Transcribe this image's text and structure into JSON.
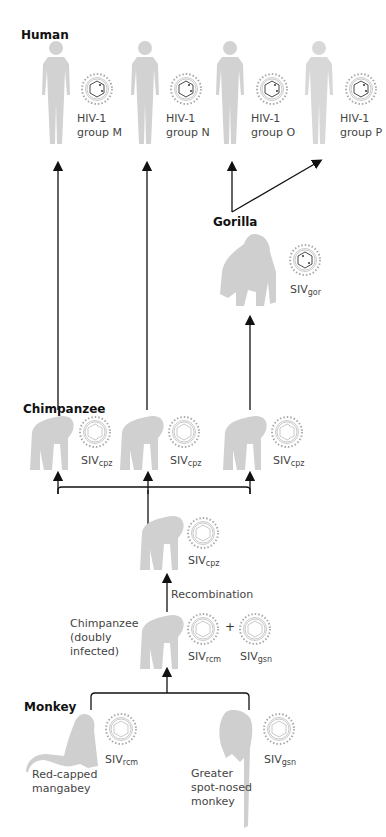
{
  "sections": {
    "human": "Human",
    "gorilla": "Gorilla",
    "chimpanzee": "Chimpanzee",
    "monkey": "Monkey"
  },
  "human_viruses": [
    {
      "line1": "HIV-1",
      "line2": "group M"
    },
    {
      "line1": "HIV-1",
      "line2": "group N"
    },
    {
      "line1": "HIV-1",
      "line2": "group O"
    },
    {
      "line1": "HIV-1",
      "line2": "group P"
    }
  ],
  "gorilla_virus": {
    "base": "SIV",
    "sub": "gor"
  },
  "chimp_viruses": [
    {
      "base": "SIV",
      "sub": "cpz"
    },
    {
      "base": "SIV",
      "sub": "cpz"
    },
    {
      "base": "SIV",
      "sub": "cpz"
    }
  ],
  "ancestral_chimp_virus": {
    "base": "SIV",
    "sub": "cpz"
  },
  "recombination_label": "Recombination",
  "doubly_infected": {
    "line1": "Chimpanzee",
    "line2": "(doubly",
    "line3": "infected)",
    "plus": "+",
    "virus_a": {
      "base": "SIV",
      "sub": "rcm"
    },
    "virus_b": {
      "base": "SIV",
      "sub": "gsn"
    }
  },
  "monkeys": [
    {
      "line1": "Red-capped",
      "line2": "mangabey",
      "virus": {
        "base": "SIV",
        "sub": "rcm"
      }
    },
    {
      "line1": "Greater",
      "line2": "spot-nosed",
      "line3": "monkey",
      "virus": {
        "base": "SIV",
        "sub": "gsn"
      }
    }
  ],
  "colors": {
    "silhouette": "#cfcfcf",
    "arrow": "#111111",
    "virus": "#9a9a9a"
  }
}
